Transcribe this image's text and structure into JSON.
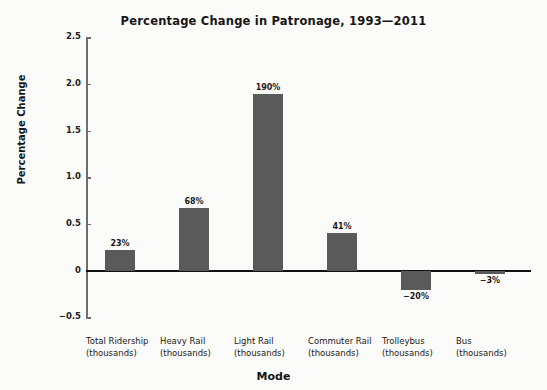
{
  "chart_data": {
    "type": "bar",
    "title": "Percentage Change in Patronage, 1993—2011",
    "xlabel": "Mode",
    "ylabel": "Percentage Change",
    "categories": [
      "Total Ridership\n(thousands)",
      "Heavy Rail\n(thousands)",
      "Light Rail\n(thousands)",
      "Commuter Rail\n(thousands)",
      "Trolleybus\n(thousands)",
      "Bus\n(thousands)"
    ],
    "category_lines": [
      [
        "Total Ridership",
        "(thousands)"
      ],
      [
        "Heavy Rail",
        "(thousands)"
      ],
      [
        "Light Rail",
        "(thousands)"
      ],
      [
        "Commuter Rail",
        "(thousands)"
      ],
      [
        "Trolleybus",
        "(thousands)"
      ],
      [
        "Bus",
        "(thousands)"
      ]
    ],
    "values": [
      0.23,
      0.68,
      1.9,
      0.41,
      -0.2,
      -0.03
    ],
    "data_labels": [
      "23%",
      "68%",
      "190%",
      "41%",
      "−20%",
      "−3%"
    ],
    "ylim": [
      -0.5,
      2.5
    ],
    "yticks": [
      2.5,
      2.0,
      1.5,
      1.0,
      0.5,
      0,
      -0.5
    ],
    "ytick_labels": [
      "2.5",
      "2.0",
      "1.5",
      "1.0",
      "0.5",
      "0",
      "−0.5"
    ],
    "grid": false,
    "legend": "none",
    "bar_color": "#5a5a5a",
    "axis_color": "#6e6e6e",
    "zero_line_color": "#111111",
    "background": "#fbfbf9"
  }
}
